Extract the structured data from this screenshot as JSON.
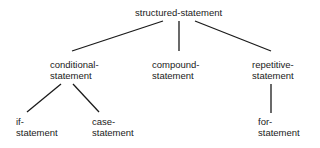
{
  "diagram": {
    "type": "tree",
    "root": {
      "id": "structured",
      "label": "structured-statement"
    },
    "nodes": [
      {
        "id": "conditional",
        "line1": "conditional-",
        "line2": "statement",
        "parent": "structured"
      },
      {
        "id": "compound",
        "line1": "compound-",
        "line2": "statement",
        "parent": "structured"
      },
      {
        "id": "repetitive",
        "line1": "repetitive-",
        "line2": "statement",
        "parent": "structured"
      },
      {
        "id": "if",
        "line1": "if-",
        "line2": "statement",
        "parent": "conditional"
      },
      {
        "id": "case",
        "line1": "case-",
        "line2": "statement",
        "parent": "conditional"
      },
      {
        "id": "for",
        "line1": "for-",
        "line2": "statement",
        "parent": "repetitive"
      }
    ],
    "edge_color": "#1a1a1a"
  }
}
